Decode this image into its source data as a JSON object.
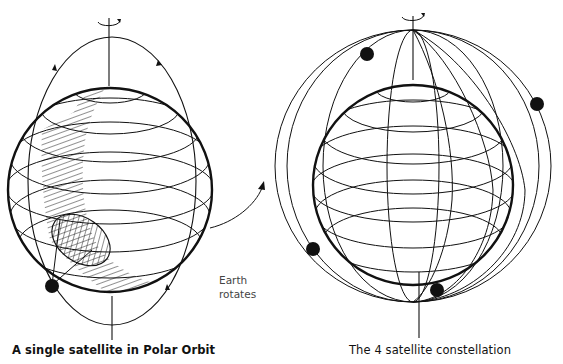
{
  "diagram": {
    "left_panel": {
      "caption": "A single satellite in Polar Orbit",
      "satellites": 1,
      "elements": [
        "rotation-axis",
        "globe",
        "latitude-lines",
        "polar-orbit",
        "satellite",
        "coverage-swath-hatched",
        "footprint-ellipse"
      ]
    },
    "middle": {
      "label_line1": "Earth",
      "label_line2": "rotates",
      "arrow": "curved-arrow"
    },
    "right_panel": {
      "caption": "The 4 satellite constellation",
      "satellites": 4,
      "elements": [
        "rotation-axis",
        "globe",
        "latitude-lines",
        "polar-orbits",
        "satellites"
      ]
    },
    "colors": {
      "ink": "#111111",
      "background": "#ffffff"
    }
  }
}
